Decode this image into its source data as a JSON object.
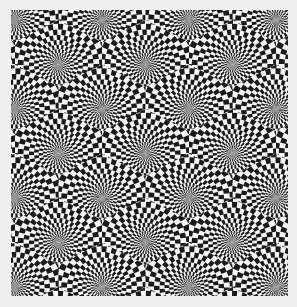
{
  "image": {
    "description": "Op-art optical illusion: tiled radial checkerboard spirals",
    "background": "#efefef",
    "frame": {
      "x": 11,
      "y": 10,
      "width": 277,
      "height": 286
    },
    "colors": {
      "dark": "#1a1a1a",
      "light": "#f4f4f4"
    },
    "lattice": {
      "origin_x": 4,
      "origin_y": 10,
      "dx": 87,
      "dy": 44.5,
      "rows": 7,
      "stagger": 43.5
    },
    "pattern": {
      "sectors": 48,
      "rings": 14,
      "max_radius": 60,
      "twist": 0.35
    }
  }
}
